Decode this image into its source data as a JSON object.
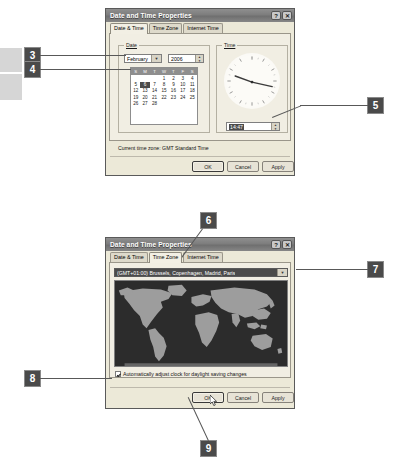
{
  "figure": {
    "callouts": [
      {
        "id": "3",
        "number": "3"
      },
      {
        "id": "4",
        "number": "4"
      },
      {
        "id": "5",
        "number": "5"
      },
      {
        "id": "6",
        "number": "6"
      },
      {
        "id": "7",
        "number": "7"
      },
      {
        "id": "8",
        "number": "8"
      },
      {
        "id": "9",
        "number": "9"
      }
    ]
  },
  "dialog1": {
    "title": "Date and Time Properties",
    "help_button": "?",
    "close_button": "✕",
    "tabs": [
      {
        "label": "Date & Time",
        "active": true
      },
      {
        "label": "Time Zone",
        "active": false
      },
      {
        "label": "Internet Time",
        "active": false
      }
    ],
    "date_group": {
      "label": "Date",
      "month_value": "February",
      "year_value": "2006",
      "dropdown_arrow": "▼",
      "spin_up": "▲",
      "spin_down": "▼",
      "day_headers": [
        "S",
        "M",
        "T",
        "W",
        "T",
        "F",
        "S"
      ],
      "leading_blanks": 3,
      "days": [
        1,
        2,
        3,
        4,
        5,
        6,
        7,
        8,
        9,
        10,
        11,
        12,
        13,
        14,
        15,
        16,
        17,
        18,
        19,
        20,
        21,
        22,
        23,
        24,
        25,
        26,
        27,
        28
      ],
      "selected_day": 6
    },
    "time_group": {
      "label": "Time",
      "time_value": "14:47",
      "spin_up": "▲",
      "spin_down": "▼"
    },
    "status": "Current time zone:  GMT Standard Time",
    "buttons": {
      "ok": "OK",
      "cancel": "Cancel",
      "apply": "Apply"
    }
  },
  "dialog2": {
    "title": "Date and Time Properties",
    "help_button": "?",
    "close_button": "✕",
    "tabs": [
      {
        "label": "Date & Time",
        "active": false
      },
      {
        "label": "Time Zone",
        "active": true
      },
      {
        "label": "Internet Time",
        "active": false
      }
    ],
    "timezone_value": "(GMT+01:00) Brussels, Copenhagen, Madrid, Paris",
    "dropdown_arrow": "▼",
    "dst_checkbox_label": "Automatically adjust clock for daylight saving changes",
    "dst_checked": true,
    "buttons": {
      "ok": "OK",
      "cancel": "Cancel",
      "apply": "Apply"
    }
  }
}
